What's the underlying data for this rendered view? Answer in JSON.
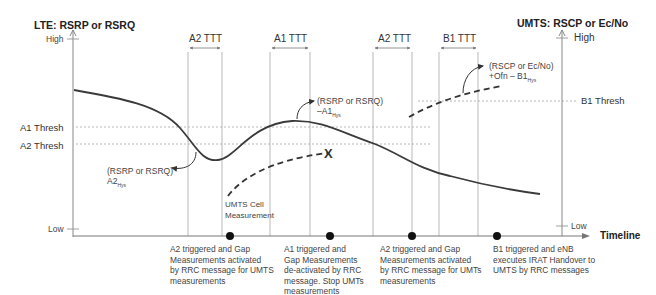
{
  "axes": {
    "left_title": "LTE: RSRP or RSRQ",
    "right_title": "UMTS: RSCP or Ec/No",
    "left_high": "High",
    "left_low": "Low",
    "right_high": "High",
    "right_low": "Low",
    "x_label": "Timeline"
  },
  "thresholds": {
    "a1": "A1 Thresh",
    "a2": "A2 Thresh",
    "b1": "B1 Thresh"
  },
  "ttt_windows": [
    {
      "label": "A2 TTT"
    },
    {
      "label": "A1 TTT"
    },
    {
      "label": "A2 TTT"
    },
    {
      "label": "B1 TTT"
    }
  ],
  "annotations": {
    "a2_hys_line1": "(RSRP or RSRQ)",
    "a2_hys_line2": "A2",
    "a2_hys_sub": "Hys",
    "a1_hys_line1": "(RSRP or RSRQ)",
    "a1_hys_line2": "–A1",
    "a1_hys_sub": "Hys",
    "b1_hys_line1": "(RSCP or Ec/No)",
    "b1_hys_line2": "+Ofn – B1",
    "b1_hys_sub": "Hys",
    "umts_cell_meas": "UMTS Cell\nMeasurement",
    "stop_marker": "X"
  },
  "events": [
    {
      "caption": "A2 triggered and Gap\nMeasurements activated\nby RRC message for UMTS\nmeasurements"
    },
    {
      "caption": "A1 triggered and\nGap Measurements\nde-activated by RRC\nmessage. Stop UMTs\nmeasurements"
    },
    {
      "caption": "A2 triggered and Gap\nMeasurements activated\nby RRC message for UMTs\nmeasurements"
    },
    {
      "caption": "B1 triggered and eNB\nexecutes IRAT Handover to\nUMTS by RRC messages"
    }
  ],
  "colors": {
    "curve": "#3a3a3a",
    "grid": "#b8b8b8",
    "threshold": "#b0b0b0",
    "text": "#444444"
  }
}
